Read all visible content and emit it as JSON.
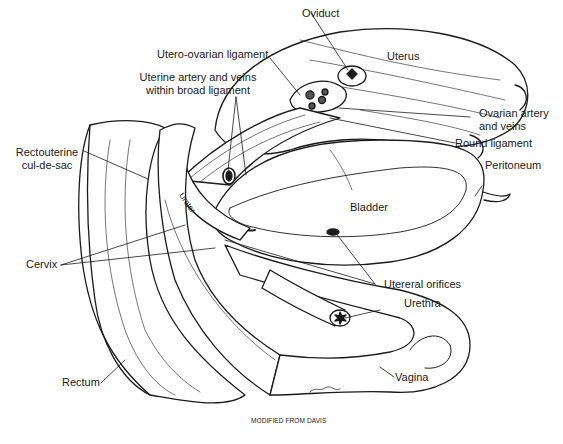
{
  "figure": {
    "type": "anatomical-illustration",
    "credit": "MODIFIED FROM DAVIS",
    "signature": "T. Sims",
    "colors": {
      "ink": "#1a1a1a",
      "background": "#ffffff"
    }
  },
  "labels": {
    "oviduct": "Oviduct",
    "uterus": "Uterus",
    "utero_ovarian_ligament": "Utero-ovarian ligament",
    "uterine_artery_line1": "Uterine artery and veins",
    "uterine_artery_line2": "within broad ligament",
    "ovarian_artery_line1": "Ovarian artery",
    "ovarian_artery_line2": "and veins",
    "round_ligament": "Round ligament",
    "rectouterine_line1": "Rectouterine",
    "rectouterine_line2": "cul-de-sac",
    "peritoneum": "Peritoneum",
    "ureter": "Ureter",
    "bladder": "Bladder",
    "cervix": "Cervix",
    "ureteral_orifices": "Utereral orifices",
    "urethra": "Urethra",
    "rectum": "Rectum",
    "vagina": "Vagina"
  }
}
